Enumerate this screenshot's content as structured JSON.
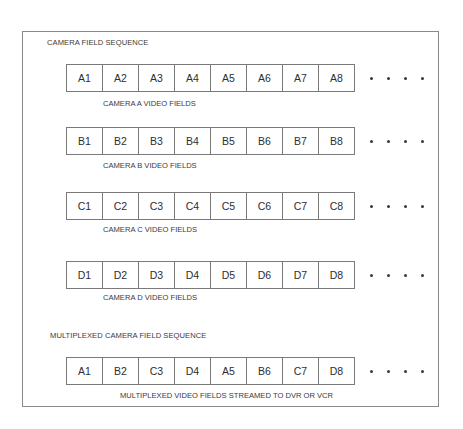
{
  "diagram": {
    "title": "CAMERA FIELD SEQUENCE",
    "multiplexed_title": "MULTIPLEXED CAMERA FIELD SEQUENCE",
    "continuation_glyph": "• • • •",
    "rows": [
      {
        "id": "camera-a",
        "cells": [
          "A1",
          "A2",
          "A3",
          "A4",
          "A5",
          "A6",
          "A7",
          "A8"
        ],
        "caption": "CAMERA A VIDEO FIELDS"
      },
      {
        "id": "camera-b",
        "cells": [
          "B1",
          "B2",
          "B3",
          "B4",
          "B5",
          "B6",
          "B7",
          "B8"
        ],
        "caption": "CAMERA B VIDEO FIELDS"
      },
      {
        "id": "camera-c",
        "cells": [
          "C1",
          "C2",
          "C3",
          "C4",
          "C5",
          "C6",
          "C7",
          "C8"
        ],
        "caption": "CAMERA C VIDEO FIELDS"
      },
      {
        "id": "camera-d",
        "cells": [
          "D1",
          "D2",
          "D3",
          "D4",
          "D5",
          "D6",
          "D7",
          "D8"
        ],
        "caption": "CAMERA D VIDEO FIELDS"
      },
      {
        "id": "multiplexed",
        "cells": [
          "A1",
          "B2",
          "C3",
          "D4",
          "A5",
          "B6",
          "C7",
          "D8"
        ],
        "caption": "MULTIPLEXED VIDEO FIELDS STREAMED TO DVR OR VCR"
      }
    ]
  },
  "colors": {
    "line": "#7a7a7a",
    "text": "#3a3a3a",
    "background": "#ffffff"
  }
}
